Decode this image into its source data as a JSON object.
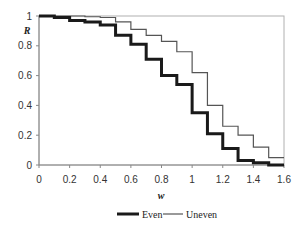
{
  "chart_data": {
    "type": "line",
    "step": true,
    "title": "",
    "xlabel": "w",
    "ylabel": "R",
    "xlim": [
      0,
      1.6
    ],
    "ylim": [
      0,
      1
    ],
    "xticks": [
      "0",
      "0.2",
      "0.4",
      "0.6",
      "0.8",
      "1",
      "1.2",
      "1.4",
      "1.6"
    ],
    "yticks": [
      "0",
      "0.2",
      "0.4",
      "0.6",
      "0.8",
      "1"
    ],
    "grid": false,
    "legend_position": "bottom",
    "series": [
      {
        "name": "Even",
        "color": "#1a1a1a",
        "line_width": 3,
        "x": [
          0,
          0.1,
          0.2,
          0.3,
          0.4,
          0.5,
          0.6,
          0.7,
          0.8,
          0.9,
          1.0,
          1.1,
          1.2,
          1.3,
          1.4,
          1.5,
          1.6
        ],
        "values": [
          1.0,
          0.99,
          0.97,
          0.96,
          0.94,
          0.87,
          0.81,
          0.71,
          0.6,
          0.54,
          0.35,
          0.21,
          0.11,
          0.03,
          0.015,
          0.0,
          0.0
        ]
      },
      {
        "name": "Uneven",
        "color": "#555555",
        "line_width": 1.2,
        "x": [
          0,
          0.1,
          0.2,
          0.3,
          0.4,
          0.5,
          0.6,
          0.7,
          0.8,
          0.9,
          1.0,
          1.1,
          1.2,
          1.3,
          1.4,
          1.5,
          1.6
        ],
        "values": [
          1.0,
          1.0,
          1.0,
          0.995,
          0.99,
          0.96,
          0.91,
          0.87,
          0.83,
          0.76,
          0.62,
          0.4,
          0.26,
          0.2,
          0.12,
          0.05,
          0.05
        ]
      }
    ]
  },
  "legend": {
    "items": [
      {
        "label": "Even"
      },
      {
        "label": "Uneven"
      }
    ]
  }
}
